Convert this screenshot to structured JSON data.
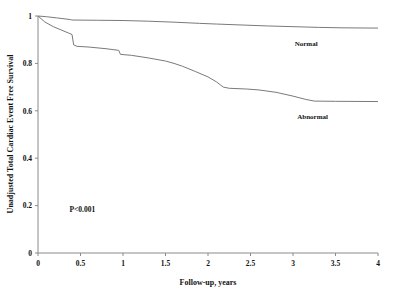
{
  "chart_data": {
    "type": "line",
    "title": "",
    "subtitle": "",
    "xlabel": "Follow-up, years",
    "ylabel": "Unadjusted Total Cardiac Event Free Survival",
    "xlim": [
      0,
      4
    ],
    "ylim": [
      0,
      1
    ],
    "grid": false,
    "legend_position": "inline-right",
    "xticks": [
      0,
      0.5,
      1,
      1.5,
      2,
      2.5,
      3,
      3.5,
      4
    ],
    "xtick_labels": [
      "0",
      "0.5",
      "1",
      "1.5",
      "2",
      "2.5",
      "3",
      "3.5",
      "4"
    ],
    "yticks": [
      0,
      0.2,
      0.4,
      0.6,
      0.8,
      1
    ],
    "ytick_labels": [
      "0",
      "0.2",
      "0.4",
      "0.6",
      "0.8",
      "1"
    ],
    "annotations": [
      {
        "name": "p-value",
        "text": "P<0.001",
        "x": 0.37,
        "y": 0.175
      }
    ],
    "series": [
      {
        "name": "Normal",
        "label": "Normal",
        "color": "#7a7a7a",
        "label_x": 3.02,
        "label_y": 0.875,
        "points": [
          [
            0.0,
            1.0
          ],
          [
            0.1,
            0.997
          ],
          [
            0.22,
            0.992
          ],
          [
            0.38,
            0.985
          ],
          [
            0.4,
            0.983
          ],
          [
            0.7,
            0.982
          ],
          [
            1.0,
            0.981
          ],
          [
            1.3,
            0.978
          ],
          [
            1.6,
            0.974
          ],
          [
            1.9,
            0.969
          ],
          [
            2.1,
            0.966
          ],
          [
            2.4,
            0.962
          ],
          [
            2.7,
            0.958
          ],
          [
            3.0,
            0.955
          ],
          [
            3.3,
            0.952
          ],
          [
            3.6,
            0.95
          ],
          [
            4.0,
            0.949
          ]
        ]
      },
      {
        "name": "Abnormal",
        "label": "Abnormal",
        "color": "#7a7a7a",
        "label_x": 3.05,
        "label_y": 0.565,
        "points": [
          [
            0.0,
            1.0
          ],
          [
            0.08,
            0.975
          ],
          [
            0.18,
            0.955
          ],
          [
            0.28,
            0.94
          ],
          [
            0.36,
            0.928
          ],
          [
            0.4,
            0.922
          ],
          [
            0.42,
            0.878
          ],
          [
            0.46,
            0.872
          ],
          [
            0.6,
            0.869
          ],
          [
            0.8,
            0.862
          ],
          [
            0.95,
            0.855
          ],
          [
            0.97,
            0.838
          ],
          [
            1.1,
            0.834
          ],
          [
            1.3,
            0.823
          ],
          [
            1.5,
            0.81
          ],
          [
            1.6,
            0.8
          ],
          [
            1.7,
            0.788
          ],
          [
            1.85,
            0.766
          ],
          [
            2.0,
            0.743
          ],
          [
            2.1,
            0.722
          ],
          [
            2.18,
            0.7
          ],
          [
            2.25,
            0.695
          ],
          [
            2.45,
            0.692
          ],
          [
            2.6,
            0.688
          ],
          [
            2.8,
            0.678
          ],
          [
            3.0,
            0.662
          ],
          [
            3.15,
            0.648
          ],
          [
            3.25,
            0.641
          ],
          [
            3.5,
            0.64
          ],
          [
            4.0,
            0.639
          ]
        ]
      }
    ]
  }
}
